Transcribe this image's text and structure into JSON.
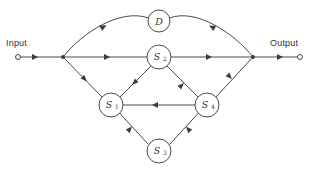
{
  "diagram": {
    "type": "signal-flow-graph",
    "colors": {
      "background": "#ffffff",
      "line": "#4a4a48",
      "arrow": "#3c3c3a",
      "text": "#33332e"
    },
    "terminals": {
      "input": {
        "label": "Input",
        "x": 16,
        "y": 57
      },
      "output": {
        "label": "Output",
        "x": 302,
        "y": 57
      }
    },
    "junctions": [
      {
        "name": "input-junction",
        "x": 63,
        "y": 57
      },
      {
        "name": "output-junction",
        "x": 253,
        "y": 57
      }
    ],
    "nodes": [
      {
        "id": "D",
        "label": "D",
        "sub": "",
        "x": 159,
        "y": 21,
        "r": 11
      },
      {
        "id": "S2",
        "label": "S",
        "sub": "2",
        "x": 159,
        "y": 57,
        "r": 12
      },
      {
        "id": "S1",
        "label": "S",
        "sub": "1",
        "x": 111,
        "y": 105,
        "r": 12
      },
      {
        "id": "S4",
        "label": "S",
        "sub": "4",
        "x": 207,
        "y": 105,
        "r": 12
      },
      {
        "id": "S3",
        "label": "S",
        "sub": "3",
        "x": 159,
        "y": 151,
        "r": 12
      }
    ],
    "edges": [
      {
        "name": "edge-input-to-junction",
        "from": "input",
        "to": "input-junction",
        "direction": "right"
      },
      {
        "name": "edge-junction-to-s2",
        "from": "input-junction",
        "to": "S2",
        "direction": "right"
      },
      {
        "name": "edge-s2-to-junction",
        "from": "S2",
        "to": "output-junction",
        "direction": "right"
      },
      {
        "name": "edge-junction-to-output",
        "from": "output-junction",
        "to": "output",
        "direction": "right"
      },
      {
        "name": "edge-d-arc-left",
        "from": "D",
        "to": "input-junction",
        "direction": "left"
      },
      {
        "name": "edge-d-arc-right",
        "from": "output-junction",
        "to": "D",
        "direction": "up-left"
      },
      {
        "name": "edge-junction-to-s1",
        "from": "input-junction",
        "to": "S1",
        "direction": "down-right"
      },
      {
        "name": "edge-s1-to-s2",
        "from": "S1",
        "to": "S2",
        "direction": "up-right"
      },
      {
        "name": "edge-s2-to-s4",
        "from": "S2",
        "to": "S4",
        "direction": "down-right"
      },
      {
        "name": "edge-s4-to-junction",
        "from": "S4",
        "to": "output-junction",
        "direction": "up-right"
      },
      {
        "name": "edge-s4-to-s1",
        "from": "S4",
        "to": "S1",
        "direction": "left"
      },
      {
        "name": "edge-s1-to-s3",
        "from": "S1",
        "to": "S3",
        "direction": "down-right"
      },
      {
        "name": "edge-s4-to-s3",
        "from": "S4",
        "to": "S3",
        "direction": "down-left"
      }
    ]
  }
}
